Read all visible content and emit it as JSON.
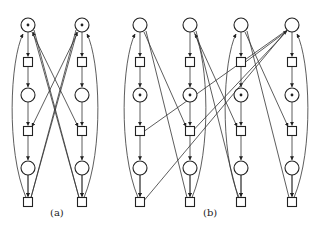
{
  "figure": {
    "subfigures": [
      {
        "label": "(a)",
        "label_pos": [
          57,
          215
        ],
        "columns_x": [
          28,
          82
        ],
        "tokened_places": [
          [
            0,
            0
          ],
          [
            1,
            0
          ]
        ]
      },
      {
        "label": "(b)",
        "label_pos": [
          210,
          215
        ],
        "columns_x": [
          140,
          190,
          241,
          292
        ],
        "tokened_places": [
          [
            0,
            1
          ],
          [
            1,
            1
          ],
          [
            2,
            1
          ],
          [
            3,
            1
          ]
        ]
      }
    ],
    "rows": {
      "place_y": [
        25,
        95,
        168
      ],
      "transition_y": [
        62,
        131,
        202
      ]
    },
    "place_radius": 7,
    "transition_size": 9,
    "colors": {
      "stroke": "#222222",
      "background": "#ffffff"
    }
  }
}
